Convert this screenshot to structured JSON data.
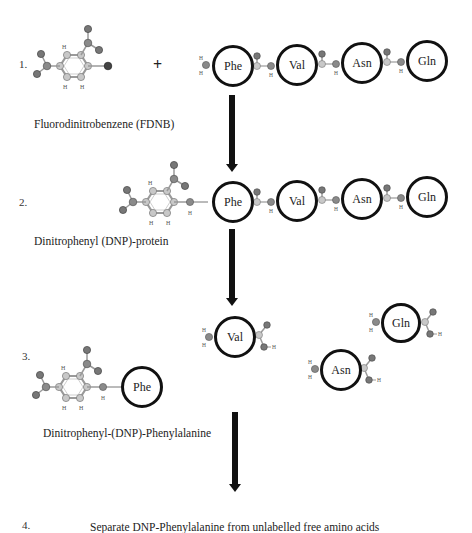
{
  "steps": [
    {
      "number": "1.",
      "caption": "Fluorodinitrobenzene (FDNB)",
      "operator": "+"
    },
    {
      "number": "2.",
      "caption": "Dinitrophenyl (DNP)-protein"
    },
    {
      "number": "3.",
      "caption": "Dinitrophenyl-(DNP)-Phenylalanine"
    },
    {
      "number": "4.",
      "caption": "Separate DNP-Phenylalanine from unlabelled free amino acids"
    }
  ],
  "peptide": {
    "residues": [
      "Phe",
      "Val",
      "Asn",
      "Gln"
    ]
  },
  "step3": {
    "labelled_residue": "Phe",
    "free_amino_acids": [
      "Val",
      "Gln",
      "Asn"
    ]
  },
  "atoms": {
    "N": "N",
    "O": "O",
    "C": "C",
    "H": "H",
    "F": "F"
  },
  "colors": {
    "residue_border": "#111111",
    "arrow": "#111111",
    "atom_carbon": "#c8c8c8",
    "atom_nitrogen": "#8a8a8a",
    "atom_oxygen": "#777777",
    "atom_fluorine": "#444444",
    "bond": "#9a9a9a"
  }
}
